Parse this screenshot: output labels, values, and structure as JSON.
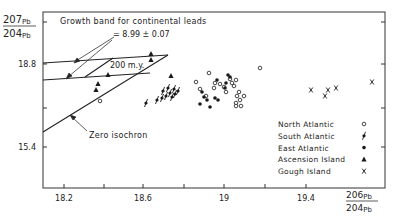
{
  "chart_data": {
    "type": "scatter",
    "title": "",
    "xlabel": "206Pb/204Pb",
    "ylabel": "207Pb/204Pb",
    "axis_labels": {
      "x": {
        "num": "206",
        "num_sub": "Pb",
        "den": "204",
        "den_sub": "Pb"
      },
      "y": {
        "num": "207",
        "num_sub": "Pb",
        "den": "204",
        "den_sub": "Pb"
      }
    },
    "xlim": [
      18.1,
      19.8
    ],
    "x_ticks": [
      {
        "px": 64,
        "label": "18.2"
      },
      {
        "px": 104,
        "label": ""
      },
      {
        "px": 143,
        "label": "18.6"
      },
      {
        "px": 184,
        "label": ""
      },
      {
        "px": 224,
        "label": "19"
      },
      {
        "px": 265,
        "label": ""
      },
      {
        "px": 306,
        "label": "19.4"
      }
    ],
    "y_ticks": [
      {
        "py": 22,
        "label": ""
      },
      {
        "py": 64,
        "label": "18.8"
      },
      {
        "py": 108,
        "label": ""
      },
      {
        "py": 147,
        "label": "15.4"
      }
    ],
    "right_ticks_py": [
      22,
      64,
      108,
      147
    ],
    "grid": false,
    "legend_position": "lower-right inside",
    "annotations": {
      "growth_band": "Growth band for continental leads",
      "mu": "= 8.99 ± 0.07",
      "isochron_200": "200 m.y.",
      "zero_isochron": "Zero isochron"
    },
    "lines": [
      {
        "name": "growth-band-upper",
        "x1": 43,
        "y1": 63,
        "x2": 168,
        "y2": 55
      },
      {
        "name": "growth-band-lower",
        "x1": 43,
        "y1": 80,
        "x2": 150,
        "y2": 73
      },
      {
        "name": "zero-isochron",
        "x1": 43,
        "y1": 132,
        "x2": 168,
        "y2": 55
      },
      {
        "name": "isochron-200my",
        "x1": 85,
        "y1": 77,
        "x2": 113,
        "y2": 58
      }
    ],
    "series": [
      {
        "name": "North Atlantic",
        "marker": "open-circle",
        "points_px": [
          [
            100,
            101
          ],
          [
            209,
            73
          ],
          [
            260,
            68
          ],
          [
            196,
            82
          ],
          [
            200,
            89
          ],
          [
            206,
            96
          ],
          [
            214,
            88
          ],
          [
            215,
            83
          ],
          [
            220,
            84
          ],
          [
            224,
            87
          ],
          [
            226,
            92
          ],
          [
            230,
            79
          ],
          [
            232,
            83
          ],
          [
            234,
            86
          ],
          [
            236,
            80
          ],
          [
            237,
            96
          ],
          [
            239,
            92
          ],
          [
            240,
            100
          ],
          [
            236,
            103
          ],
          [
            236,
            106
          ],
          [
            241,
            106
          ],
          [
            244,
            96
          ]
        ]
      },
      {
        "name": "South Atlantic",
        "marker": "slashed-dot",
        "points_px": [
          [
            146,
            103
          ],
          [
            157,
            100
          ],
          [
            163,
            91
          ],
          [
            166,
            96
          ],
          [
            168,
            88
          ],
          [
            170,
            93
          ],
          [
            172,
            97
          ],
          [
            174,
            89
          ],
          [
            175,
            94
          ],
          [
            178,
            91
          ],
          [
            162,
            98
          ]
        ]
      },
      {
        "name": "East Atlantic",
        "marker": "filled-circle",
        "points_px": [
          [
            202,
            92
          ],
          [
            204,
            97
          ],
          [
            207,
            100
          ],
          [
            215,
            98
          ],
          [
            218,
            100
          ],
          [
            217,
            80
          ],
          [
            226,
            83
          ],
          [
            228,
            75
          ],
          [
            230,
            77
          ],
          [
            225,
            88
          ],
          [
            200,
            104
          ],
          [
            210,
            107
          ]
        ]
      },
      {
        "name": "Ascension Island",
        "marker": "filled-triangle",
        "points_px": [
          [
            151,
            54
          ],
          [
            151,
            60
          ],
          [
            108,
            75
          ],
          [
            98,
            84
          ],
          [
            96,
            90
          ],
          [
            171,
            76
          ]
        ]
      },
      {
        "name": "Gough Island",
        "marker": "x",
        "points_px": [
          [
            311,
            90
          ],
          [
            325,
            96
          ],
          [
            328,
            90
          ],
          [
            336,
            88
          ],
          [
            372,
            82
          ]
        ]
      }
    ]
  },
  "legend": [
    {
      "label": "North Atlantic",
      "marker": "open-circle"
    },
    {
      "label": "South Atlantic",
      "marker": "slashed-dot"
    },
    {
      "label": "East Atlantic",
      "marker": "filled-circle"
    },
    {
      "label": "Ascension Island",
      "marker": "filled-triangle"
    },
    {
      "label": "Gough Island",
      "marker": "x"
    }
  ],
  "colors": {
    "ink": "#1a1a1a",
    "background": "#ffffff"
  }
}
